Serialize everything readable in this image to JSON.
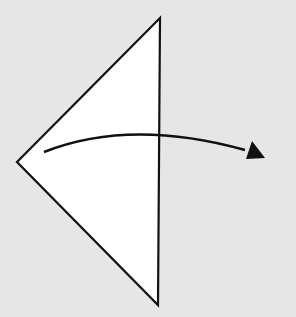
{
  "diagram": {
    "type": "origami-fold-step",
    "background": "#e6e6e6",
    "paper_fill": "#ffffff",
    "stroke": "#111111",
    "shape": {
      "kind": "triangle",
      "points": [
        [
          160,
          18
        ],
        [
          17,
          162
        ],
        [
          158,
          305
        ]
      ]
    },
    "arrow": {
      "kind": "fold-over",
      "direction": "right",
      "start": [
        44,
        152
      ],
      "control": [
        160,
        110
      ],
      "end": [
        258,
        153
      ]
    }
  }
}
